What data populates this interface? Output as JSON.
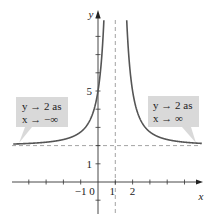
{
  "chart_data": {
    "type": "line",
    "title": "",
    "xlabel": "x",
    "ylabel": "y",
    "xlim": [
      -4.5,
      6.2
    ],
    "ylim": [
      -2.3,
      9.8
    ],
    "grid": false,
    "function": "y = 2 + 3/(x-1)^2",
    "series": [
      {
        "name": "curve",
        "color": "#555555"
      }
    ],
    "asymptotes": {
      "vertical_x": 1,
      "horizontal_y": 2
    },
    "x_ticks": [
      -4,
      -3,
      -2,
      -1,
      1,
      2,
      3,
      4,
      5
    ],
    "x_tick_labels": [
      {
        "value": -1,
        "text": "−1"
      },
      {
        "value": 0,
        "text": "0"
      },
      {
        "value": 1,
        "text": "1"
      },
      {
        "value": 2,
        "text": "2"
      }
    ],
    "y_ticks": [
      -1,
      1,
      2,
      3,
      4,
      5,
      6,
      7,
      8,
      9
    ],
    "y_tick_labels": [
      {
        "value": 1,
        "text": "1"
      },
      {
        "value": 5,
        "text": "5"
      }
    ],
    "annotations": [
      {
        "side": "left",
        "line1": "y → 2 as",
        "line2": "x → −∞"
      },
      {
        "side": "right",
        "line1": "y → 2 as",
        "line2": "x → ∞"
      }
    ]
  }
}
